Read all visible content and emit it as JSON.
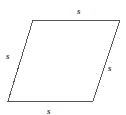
{
  "figure": {
    "name": "parallelogram-with-equal-side-labels",
    "shape_type": "parallelogram",
    "stroke_color": "#555555",
    "fill_color": "#ffffff",
    "background_color": "#ffffff",
    "stroke_width": 1,
    "vertices": {
      "top_left": [
        33,
        20
      ],
      "top_right": [
        120,
        20
      ],
      "bottom_right": [
        93,
        101
      ],
      "bottom_left": [
        8,
        101
      ]
    },
    "polygon_points": "33,20 120,20 93,101 8,101"
  },
  "labels": {
    "top": "s",
    "left": "s",
    "right": "s",
    "bottom": "s"
  }
}
